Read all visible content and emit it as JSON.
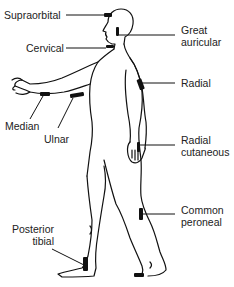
{
  "diagram": {
    "type": "anatomical-nerve-locations",
    "line_color": "#111111",
    "marker_color": "#111111",
    "labels": [
      {
        "id": "supraorbital",
        "text": "Supraorbital",
        "lines": [
          "Supraorbital"
        ],
        "side": "left"
      },
      {
        "id": "cervical",
        "text": "Cervical",
        "lines": [
          "Cervical"
        ],
        "side": "left"
      },
      {
        "id": "great-auricular",
        "text": "Great auricular",
        "lines": [
          "Great",
          "auricular"
        ],
        "side": "right"
      },
      {
        "id": "radial",
        "text": "Radial",
        "lines": [
          "Radial"
        ],
        "side": "right"
      },
      {
        "id": "median",
        "text": "Median",
        "lines": [
          "Median"
        ],
        "side": "left"
      },
      {
        "id": "ulnar",
        "text": "Ulnar",
        "lines": [
          "Ulnar"
        ],
        "side": "left"
      },
      {
        "id": "radial-cutaneous",
        "text": "Radial cutaneous",
        "lines": [
          "Radial",
          "cutaneous"
        ],
        "side": "right"
      },
      {
        "id": "posterior-tibial",
        "text": "Posterior tibial",
        "lines": [
          "Posterior",
          "tibial"
        ],
        "side": "left"
      },
      {
        "id": "common-peroneal",
        "text": "Common peroneal",
        "lines": [
          "Common",
          "peroneal"
        ],
        "side": "right"
      }
    ]
  }
}
